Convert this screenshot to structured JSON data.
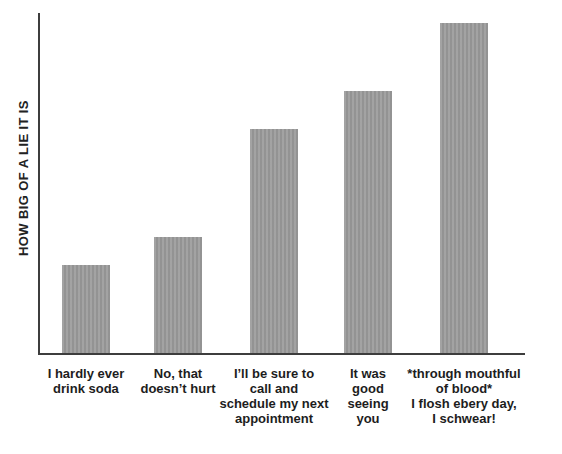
{
  "chart_data": {
    "type": "bar",
    "title": "",
    "xlabel": "",
    "ylabel": "HOW BIG OF A LIE IT IS",
    "categories": [
      "I hardly ever drink soda",
      "No, that doesn’t hurt",
      "I’ll be sure to call and schedule my next appointment",
      "It was good seeing you",
      "*through mouthful of blood* I flosh ebery day, I schwear!"
    ],
    "category_lines": [
      [
        "I hardly ever",
        "drink soda"
      ],
      [
        "No, that",
        "doesn’t hurt"
      ],
      [
        "I’ll be sure to",
        "call and",
        "schedule my next",
        "appointment"
      ],
      [
        "It was",
        "good",
        "seeing",
        "you"
      ],
      [
        "*through mouthful",
        "of blood*",
        "I flosh ebery day,",
        "I schwear!"
      ]
    ],
    "values": [
      26,
      34,
      66,
      77,
      97
    ],
    "ylim": [
      0,
      100
    ],
    "grid": false,
    "legend": null,
    "y_ticks": [],
    "x_ticks": [],
    "bar_color": "#9b9b9b",
    "axis_color": "#3d3d3d",
    "text_color": "#1d1d1d",
    "background_color": "#ffffff",
    "layout": {
      "bar_width_px": 48,
      "bar_centers_px": [
        86,
        178,
        274,
        368,
        464
      ],
      "plot_top_px": 13,
      "baseline_px": 353,
      "axis_left_px": 38,
      "axis_right_px": 525,
      "labels_top_px": 366
    }
  }
}
